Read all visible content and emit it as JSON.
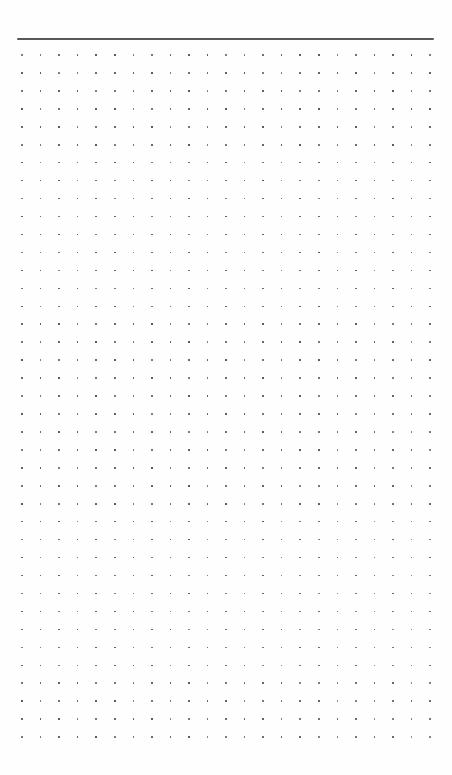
{
  "page": {
    "kind": "dot-grid-notebook-page",
    "width": 452,
    "height": 775,
    "background_color": "#ffffff",
    "paper_color": "#fefefe"
  },
  "header_rule": {
    "name": "horizontal-rule",
    "x": 17,
    "y": 38,
    "width": 417,
    "height": 2,
    "color": "#3a3a3a"
  },
  "dot_grid": {
    "name": "dot-grid",
    "columns": 23,
    "rows": 39,
    "origin_x": 22,
    "origin_y": 55,
    "spacing_x": 18.55,
    "spacing_y": 17.95,
    "dot_size": 1.6,
    "dot_color": "#565660"
  },
  "margins": {
    "top_blank_height": 38,
    "left": 22,
    "right": 22,
    "bottom_blank_height": 37
  }
}
